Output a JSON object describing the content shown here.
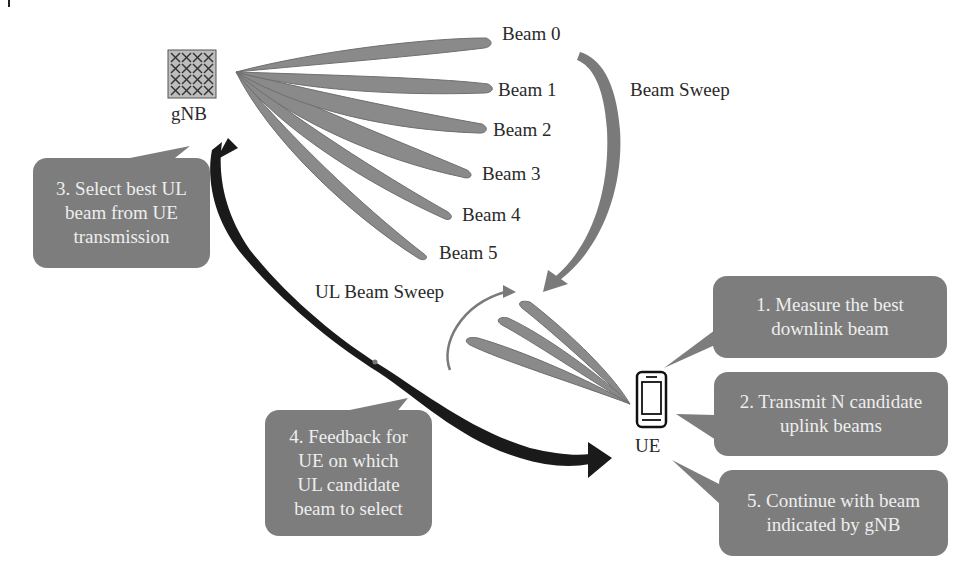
{
  "colors": {
    "beam_fill": "#8a8a8a",
    "beam_edge": "#6e6e6e",
    "callout_fill": "#7d7d7d",
    "callout_text": "#eeeeee",
    "label_text": "#2a2a2a",
    "feedback_arrow": "#1a1a1a",
    "sweep_arrow": "#7a7a7a"
  },
  "gnb": {
    "label": "gNB",
    "icon": "antenna-array-icon"
  },
  "ue": {
    "label": "UE",
    "icon": "mobile-phone-icon"
  },
  "beams": [
    {
      "label": "Beam 0"
    },
    {
      "label": "Beam 1"
    },
    {
      "label": "Beam 2"
    },
    {
      "label": "Beam 3"
    },
    {
      "label": "Beam 4"
    },
    {
      "label": "Beam 5"
    }
  ],
  "arrows": {
    "beam_sweep": "Beam Sweep",
    "ul_beam_sweep": "UL Beam Sweep"
  },
  "callouts": {
    "step1": {
      "lines": [
        "1. Measure the best",
        "downlink beam"
      ]
    },
    "step2": {
      "lines": [
        "2. Transmit N candidate",
        "uplink beams"
      ]
    },
    "step3": {
      "lines": [
        "3. Select best UL",
        "beam from UE",
        "transmission"
      ]
    },
    "step4": {
      "lines": [
        "4. Feedback for",
        "UE on which",
        "UL candidate",
        "beam to select"
      ]
    },
    "step5": {
      "lines": [
        "5. Continue with beam",
        "indicated by gNB"
      ]
    }
  }
}
